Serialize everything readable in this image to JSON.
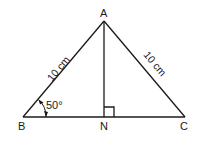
{
  "diagram": {
    "type": "isosceles-triangle",
    "vertices": {
      "A": {
        "label": "A"
      },
      "B": {
        "label": "B"
      },
      "C": {
        "label": "C"
      },
      "N": {
        "label": "N"
      }
    },
    "sides": {
      "AB": {
        "label": "10 cm"
      },
      "AC": {
        "label": "10 cm"
      }
    },
    "angle_B": {
      "label": "50°"
    },
    "right_angle_at": "N",
    "colors": {
      "stroke": "#1a1a1a",
      "background": "#ffffff"
    }
  }
}
